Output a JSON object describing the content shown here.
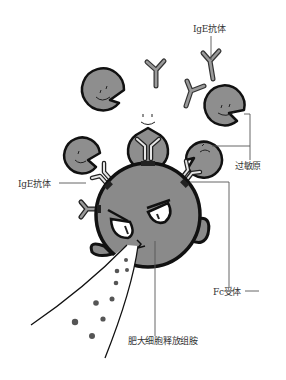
{
  "title": "肥大细胞释放组胺",
  "labels": {
    "ige_top": "IgE抗体",
    "ige_left": "IgE抗体",
    "allergen": "过敏原",
    "fc_receptor": "Fc受体",
    "mast_cell_release": "肥大细胞释放组胺"
  },
  "colors": {
    "cell_fill": "#8a8a8a",
    "outline": "#111111",
    "allergen_fill": "#8e8e8e",
    "antibody_fill": "#9a9a9a",
    "granule": "#555555",
    "leader_line": "#555555",
    "label_text": "#333333",
    "background": "#ffffff"
  }
}
